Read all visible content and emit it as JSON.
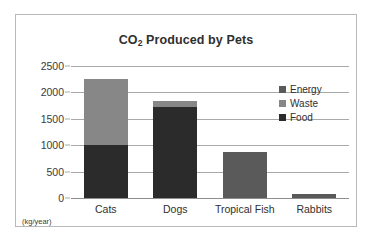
{
  "colors": {
    "food": "#2b2b2b",
    "waste": "#878787",
    "energy": "#5a5a5a",
    "grid": "#a9a9a9",
    "frame": "#b9b9b9",
    "text": "#2f2f2f",
    "background": "#ffffff"
  },
  "axis": {
    "unit_label": "(kg/year)"
  },
  "chart_data": {
    "type": "bar",
    "title": "CO2 Produced by Pets",
    "title_main": "CO",
    "title_sub": "2",
    "title_rest": " Produced by Pets",
    "xlabel": "",
    "ylabel": "",
    "unit": "kg/year",
    "stacked": true,
    "grid": true,
    "legend_position": "top-right",
    "ylim": [
      0,
      2500
    ],
    "yticks": [
      2500,
      2000,
      1500,
      1000,
      500,
      0
    ],
    "ytick_labels": [
      "2500",
      "2000",
      "1500",
      "1000",
      "500",
      "0"
    ],
    "categories": [
      "Cats",
      "Dogs",
      "Tropical Fish",
      "Rabbits"
    ],
    "series": [
      {
        "name": "Energy",
        "color": "#5a5a5a",
        "values": [
          0,
          0,
          880,
          80
        ]
      },
      {
        "name": "Waste",
        "color": "#878787",
        "values": [
          1250,
          110,
          0,
          0
        ]
      },
      {
        "name": "Food",
        "color": "#2b2b2b",
        "values": [
          1000,
          1730,
          0,
          0
        ]
      }
    ],
    "totals": [
      2250,
      1840,
      880,
      80
    ]
  },
  "legend": {
    "items": [
      {
        "label": "Energy",
        "color": "#5a5a5a"
      },
      {
        "label": "Waste",
        "color": "#878787"
      },
      {
        "label": "Food",
        "color": "#2b2b2b"
      }
    ]
  }
}
